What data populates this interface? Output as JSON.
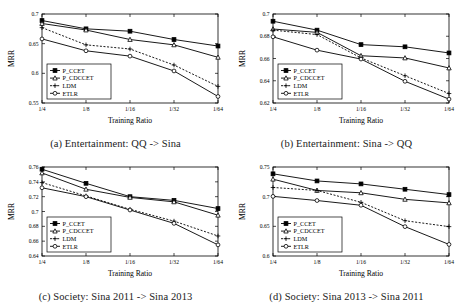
{
  "figure": {
    "ylabel": "MRR",
    "xlabel": "Training Ratio",
    "categories": [
      "1/4",
      "1/8",
      "1/16",
      "1/32",
      "1/64"
    ],
    "series_names": [
      "P_CCET",
      "P_CDCCET",
      "LDM",
      "ETLR"
    ],
    "markers": [
      "square",
      "triangle",
      "plus",
      "circle"
    ],
    "line_styles": [
      "solid",
      "solid",
      "dotted",
      "solid"
    ],
    "color": "#000000"
  },
  "panels": [
    {
      "caption": "(a) Entertainment: QQ -> Sina",
      "chart_data": {
        "type": "line",
        "title": "(a) Entertainment: QQ -> Sina",
        "xlabel": "Training Ratio",
        "ylabel": "MRR",
        "categories": [
          "1/4",
          "1/8",
          "1/16",
          "1/32",
          "1/64"
        ],
        "ylim": [
          0.55,
          0.7
        ],
        "yticks": [
          0.55,
          0.6,
          0.65,
          0.7
        ],
        "ytick_labels": [
          "0.55",
          "0.6",
          "0.65",
          "0.7"
        ],
        "grid": false,
        "legend_position": "lower-left",
        "series": [
          {
            "name": "P_CCET",
            "marker": "square",
            "style": "solid",
            "values": [
              0.689,
              0.675,
              0.671,
              0.657,
              0.646
            ]
          },
          {
            "name": "P_CDCCET",
            "marker": "triangle",
            "style": "solid",
            "values": [
              0.684,
              0.673,
              0.657,
              0.648,
              0.627
            ]
          },
          {
            "name": "LDM",
            "marker": "plus",
            "style": "dotted",
            "values": [
              0.677,
              0.648,
              0.641,
              0.614,
              0.578
            ]
          },
          {
            "name": "ETLR",
            "marker": "circle",
            "style": "solid",
            "values": [
              0.658,
              0.638,
              0.629,
              0.604,
              0.561
            ]
          }
        ]
      }
    },
    {
      "caption": "(b) Entertainment: Sina -> QQ",
      "chart_data": {
        "type": "line",
        "title": "(b) Entertainment: Sina -> QQ",
        "xlabel": "Training Ratio",
        "ylabel": "MRR",
        "categories": [
          "1/4",
          "1/8",
          "1/16",
          "1/32",
          "1/64"
        ],
        "ylim": [
          0.62,
          0.7
        ],
        "yticks": [
          0.62,
          0.64,
          0.66,
          0.68,
          0.7
        ],
        "ytick_labels": [
          "0.62",
          "0.64",
          "0.66",
          "0.68",
          "0.7"
        ],
        "grid": false,
        "legend_position": "lower-left",
        "series": [
          {
            "name": "P_CCET",
            "marker": "square",
            "style": "solid",
            "values": [
              0.6935,
              0.6855,
              0.6725,
              0.6705,
              0.665
            ]
          },
          {
            "name": "P_CDCCET",
            "marker": "triangle",
            "style": "solid",
            "values": [
              0.6865,
              0.6835,
              0.6625,
              0.6605,
              0.6515
            ]
          },
          {
            "name": "LDM",
            "marker": "plus",
            "style": "dotted",
            "values": [
              0.6855,
              0.6815,
              0.6605,
              0.6445,
              0.6285
            ]
          },
          {
            "name": "ETLR",
            "marker": "circle",
            "style": "solid",
            "values": [
              0.6795,
              0.6675,
              0.6595,
              0.6395,
              0.6235
            ]
          }
        ]
      }
    },
    {
      "caption": "(c) Society: Sina 2011 -> Sina 2013",
      "chart_data": {
        "type": "line",
        "title": "(c) Society: Sina 2011 -> Sina 2013",
        "xlabel": "Training Ratio",
        "ylabel": "MRR",
        "categories": [
          "1/4",
          "1/8",
          "1/16",
          "1/32",
          "1/64"
        ],
        "ylim": [
          0.64,
          0.76
        ],
        "yticks": [
          0.64,
          0.66,
          0.68,
          0.7,
          0.72,
          0.74,
          0.76
        ],
        "ytick_labels": [
          "0.64",
          "0.66",
          "0.68",
          "0.7",
          "0.72",
          "0.74",
          "0.76"
        ],
        "grid": false,
        "legend_position": "lower-left",
        "series": [
          {
            "name": "P_CCET",
            "marker": "square",
            "style": "solid",
            "values": [
              0.757,
              0.738,
              0.72,
              0.715,
              0.704
            ]
          },
          {
            "name": "P_CDCCET",
            "marker": "triangle",
            "style": "solid",
            "values": [
              0.752,
              0.73,
              0.719,
              0.713,
              0.695
            ]
          },
          {
            "name": "LDM",
            "marker": "plus",
            "style": "dotted",
            "values": [
              0.739,
              0.721,
              0.703,
              0.687,
              0.667
            ]
          },
          {
            "name": "ETLR",
            "marker": "circle",
            "style": "solid",
            "values": [
              0.732,
              0.72,
              0.702,
              0.684,
              0.655
            ]
          }
        ]
      }
    },
    {
      "caption": "(d) Society: Sina 2013 -> Sina 2011",
      "chart_data": {
        "type": "line",
        "title": "(d) Society: Sina 2013 -> Sina 2011",
        "xlabel": "Training Ratio",
        "ylabel": "MRR",
        "categories": [
          "1/4",
          "1/8",
          "1/16",
          "1/32",
          "1/64"
        ],
        "ylim": [
          0.6,
          0.75
        ],
        "yticks": [
          0.6,
          0.65,
          0.7,
          0.75
        ],
        "ytick_labels": [
          "0.6",
          "0.65",
          "0.7",
          "0.75"
        ],
        "grid": false,
        "legend_position": "lower-left",
        "series": [
          {
            "name": "P_CCET",
            "marker": "square",
            "style": "solid",
            "values": [
              0.7385,
              0.7265,
              0.7215,
              0.7125,
              0.7035
            ]
          },
          {
            "name": "P_CDCCET",
            "marker": "triangle",
            "style": "solid",
            "values": [
              0.7295,
              0.7105,
              0.7065,
              0.6955,
              0.6895
            ]
          },
          {
            "name": "LDM",
            "marker": "plus",
            "style": "dotted",
            "values": [
              0.7155,
              0.7105,
              0.6905,
              0.6595,
              0.6495
            ]
          },
          {
            "name": "ETLR",
            "marker": "circle",
            "style": "solid",
            "values": [
              0.7005,
              0.6935,
              0.6855,
              0.6495,
              0.6195
            ]
          }
        ]
      }
    }
  ]
}
